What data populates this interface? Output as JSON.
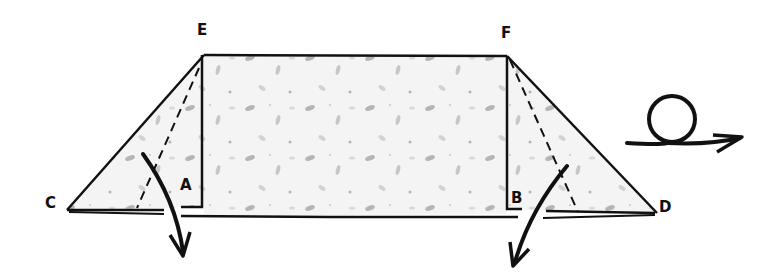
{
  "diagram": {
    "type": "origami-fold-instruction",
    "paper_texture": "mottled gray speckles (washi-style)",
    "colors": {
      "line": "#111111",
      "paper": "#f4f4f4",
      "speckle": "#9a9a9a",
      "background": "#ffffff"
    },
    "points": {
      "E": {
        "label": "E",
        "x": 204,
        "y": 55
      },
      "F": {
        "label": "F",
        "x": 507,
        "y": 56
      },
      "C": {
        "label": "C",
        "x": 67,
        "y": 210
      },
      "D": {
        "label": "D",
        "x": 657,
        "y": 213
      },
      "A": {
        "label": "A",
        "x": 202,
        "y": 207
      },
      "B": {
        "label": "B",
        "x": 507,
        "y": 209
      }
    },
    "folds": [
      {
        "name": "valley-fold-left",
        "from": "E",
        "to_base_x": 137,
        "style": "dashed"
      },
      {
        "name": "valley-fold-right",
        "from": "F",
        "to_base_x": 578,
        "style": "dashed"
      }
    ],
    "arrows": [
      {
        "name": "fold-arrow-left",
        "direction": "down"
      },
      {
        "name": "fold-arrow-right",
        "direction": "down-left"
      }
    ],
    "symbols": [
      {
        "name": "turn-over-symbol",
        "meaning": "turn the model over"
      }
    ]
  }
}
